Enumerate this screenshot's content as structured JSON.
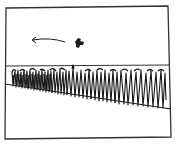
{
  "illustration": {
    "kind": "line-drawing",
    "description": "Sketch of a field of tall crops under an open sky with a small bird flying left",
    "colors": {
      "ink": "#1a1a1a",
      "frame": "#333333",
      "paper": "#ffffff"
    },
    "elements": {
      "frame": "rectangular border",
      "horizon_line": "horizontal line across the frame",
      "ground_line": "sloping line descending from left to right",
      "crop_row": "dense row of tall spiky plants",
      "bird": "small dark blob",
      "motion_arrow": "arrow pointing left"
    }
  }
}
